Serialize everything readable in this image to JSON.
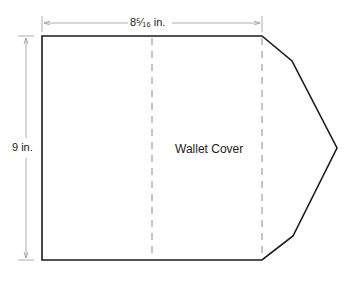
{
  "diagram": {
    "title": "Wallet Cover",
    "width_label": "8⁵⁄₁₆ in.",
    "height_label": "9 in.",
    "colors": {
      "outline": "#1a1a1a",
      "dimension": "#9a9a9a",
      "fold": "#8a8a8a"
    }
  }
}
